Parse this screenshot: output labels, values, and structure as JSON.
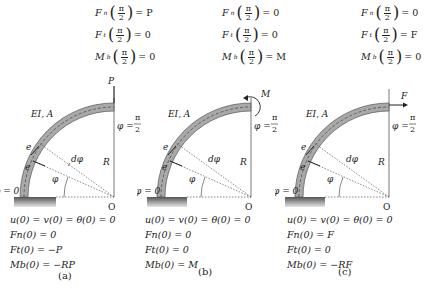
{
  "panels": [
    {
      "id": "a",
      "caption": "(a)",
      "top_bc": {
        "fn_label": "F",
        "fn_sub": "n",
        "fn_value": "= P",
        "ft_label": "F",
        "ft_sub": "t",
        "ft_value": "= 0",
        "mb_label": "M",
        "mb_sub": "b",
        "mb_value": "= 0",
        "arg_num": "π",
        "arg_den": "2"
      },
      "load_label": "P",
      "load_type": "vertical-force",
      "property_label": "EI, A",
      "phi_end_label": "φ =",
      "phi_end_num": "π",
      "phi_end_den": "2",
      "phi_start_label": "φ = 0",
      "radius_label": "R",
      "origin_label": "O",
      "et_label": "e",
      "et_sub": "t",
      "en_label": "e",
      "en_sub": "n",
      "dphi_label": "dφ",
      "phi_label": "φ",
      "base_bc": [
        "u(0) = v(0) = θ(0) = 0",
        "Fn(0) = 0",
        "Ft(0) = −P",
        "Mb(0) = −RP"
      ]
    },
    {
      "id": "b",
      "caption": "(b)",
      "top_bc": {
        "fn_label": "F",
        "fn_sub": "n",
        "fn_value": "= 0",
        "ft_label": "F",
        "ft_sub": "t",
        "ft_value": "= 0",
        "mb_label": "M",
        "mb_sub": "b",
        "mb_value": "= M",
        "arg_num": "π",
        "arg_den": "2"
      },
      "load_label": "M",
      "load_type": "moment",
      "property_label": "EI, A",
      "phi_end_label": "φ =",
      "phi_end_num": "π",
      "phi_end_den": "2",
      "phi_start_label": "φ = 0",
      "radius_label": "R",
      "origin_label": "O",
      "et_label": "e",
      "et_sub": "t",
      "en_label": "e",
      "en_sub": "n",
      "dphi_label": "dφ",
      "phi_label": "φ",
      "base_bc": [
        "u(0) = v(0) = θ(0) = 0",
        "Fn(0) = 0",
        "Ft(0) = 0",
        "Mb(0) = M"
      ]
    },
    {
      "id": "c",
      "caption": "(c)",
      "top_bc": {
        "fn_label": "F",
        "fn_sub": "n",
        "fn_value": "= 0",
        "ft_label": "F",
        "ft_sub": "t",
        "ft_value": "= F",
        "mb_label": "M",
        "mb_sub": "b",
        "mb_value": "= 0",
        "arg_num": "π",
        "arg_den": "2"
      },
      "load_label": "F",
      "load_type": "horizontal-force",
      "property_label": "EI, A",
      "phi_end_label": "φ =",
      "phi_end_num": "π",
      "phi_end_den": "2",
      "phi_start_label": "φ = 0",
      "radius_label": "R",
      "origin_label": "O",
      "et_label": "e",
      "et_sub": "t",
      "en_label": "e",
      "en_sub": "n",
      "dphi_label": "dφ",
      "phi_label": "φ",
      "base_bc": [
        "u(0) = v(0) = θ(0) = 0",
        "Fn(0) = F",
        "Ft(0) = 0",
        "Mb(0) = −RF"
      ]
    }
  ],
  "colors": {
    "beam_fill": "#a9a9a9",
    "beam_edge": "#555555",
    "clamp": "#6e6e6e",
    "line": "#333333",
    "dotted": "#555555"
  }
}
